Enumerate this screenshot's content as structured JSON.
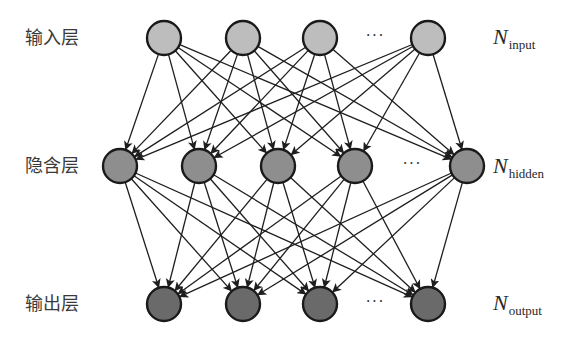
{
  "diagram": {
    "colors": {
      "edge": "#1e1e1e",
      "node_stroke": "#1a1a1a",
      "input_fill": "#bdbdbd",
      "hidden_fill": "#8e8e8e",
      "output_fill": "#6a6a6a",
      "text": "#3a3a3a"
    },
    "node_radius": 17,
    "layers": [
      {
        "id": "input",
        "label": "输入层",
        "count_symbol": "N",
        "count_subscript": "input",
        "y": 38,
        "nodes_x": [
          164,
          243,
          320,
          428
        ],
        "ellipsis_x": 375
      },
      {
        "id": "hidden",
        "label": "隐含层",
        "count_symbol": "N",
        "count_subscript": "hidden",
        "y": 166,
        "nodes_x": [
          120,
          199,
          278,
          355,
          467
        ],
        "ellipsis_x": 412
      },
      {
        "id": "output",
        "label": "输出层",
        "count_symbol": "N",
        "count_subscript": "output",
        "y": 304,
        "nodes_x": [
          164,
          243,
          320,
          428
        ],
        "ellipsis_x": 375
      }
    ],
    "ellipsis": "···",
    "connections": [
      {
        "from": "input",
        "to": "hidden",
        "type": "fully-connected",
        "arrow": true
      },
      {
        "from": "hidden",
        "to": "output",
        "type": "fully-connected",
        "arrow": true
      }
    ]
  }
}
